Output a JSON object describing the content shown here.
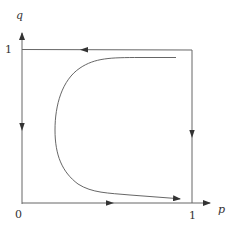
{
  "diagram": {
    "type": "phase-portrait",
    "axes": {
      "x_label": "p",
      "y_label": "q",
      "origin_label": "0",
      "x_tick_label": "1",
      "y_tick_label": "1"
    },
    "box": {
      "edges": [
        {
          "name": "top",
          "from": [
            1,
            1
          ],
          "to": [
            0,
            1
          ],
          "arrow_direction": "left"
        },
        {
          "name": "left",
          "from": [
            0,
            1
          ],
          "to": [
            0,
            0
          ],
          "arrow_direction": "down"
        },
        {
          "name": "bottom",
          "from": [
            0,
            0
          ],
          "to": [
            1,
            0
          ],
          "arrow_direction": "right"
        },
        {
          "name": "right",
          "from": [
            1,
            1
          ],
          "to": [
            1,
            0
          ],
          "arrow_direction": "down"
        }
      ]
    },
    "trajectory": {
      "description": "C-shaped trajectory starting near top-right, curving left and down, ending near bottom-right with arrow",
      "points": [
        [
          0.91,
          0.95
        ],
        [
          0.5,
          0.95
        ],
        [
          0.3,
          0.88
        ],
        [
          0.2,
          0.6
        ],
        [
          0.22,
          0.3
        ],
        [
          0.35,
          0.1
        ],
        [
          0.55,
          0.07
        ],
        [
          0.92,
          0.03
        ]
      ],
      "arrow_at_end": true
    },
    "colors": {
      "line": "#555555",
      "text": "#333333",
      "background": "#ffffff"
    }
  }
}
